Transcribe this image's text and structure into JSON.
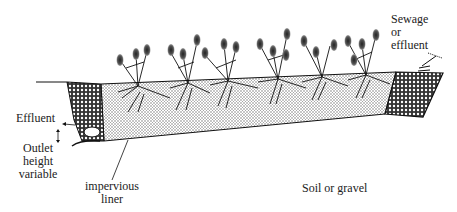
{
  "diagram": {
    "type": "cross-section",
    "plant_count": 6,
    "colors": {
      "line": "#111111",
      "bed_fill": "#cfcfcf",
      "gravel_fill": "#555555",
      "background": "#ffffff"
    }
  },
  "labels": {
    "inlet": [
      "Sewage",
      "or",
      "effluent"
    ],
    "outlet": "Effluent",
    "outlet_height": [
      "Outlet",
      "height",
      "variable"
    ],
    "liner": [
      "impervious",
      "liner"
    ],
    "soil": "Soil or gravel"
  }
}
